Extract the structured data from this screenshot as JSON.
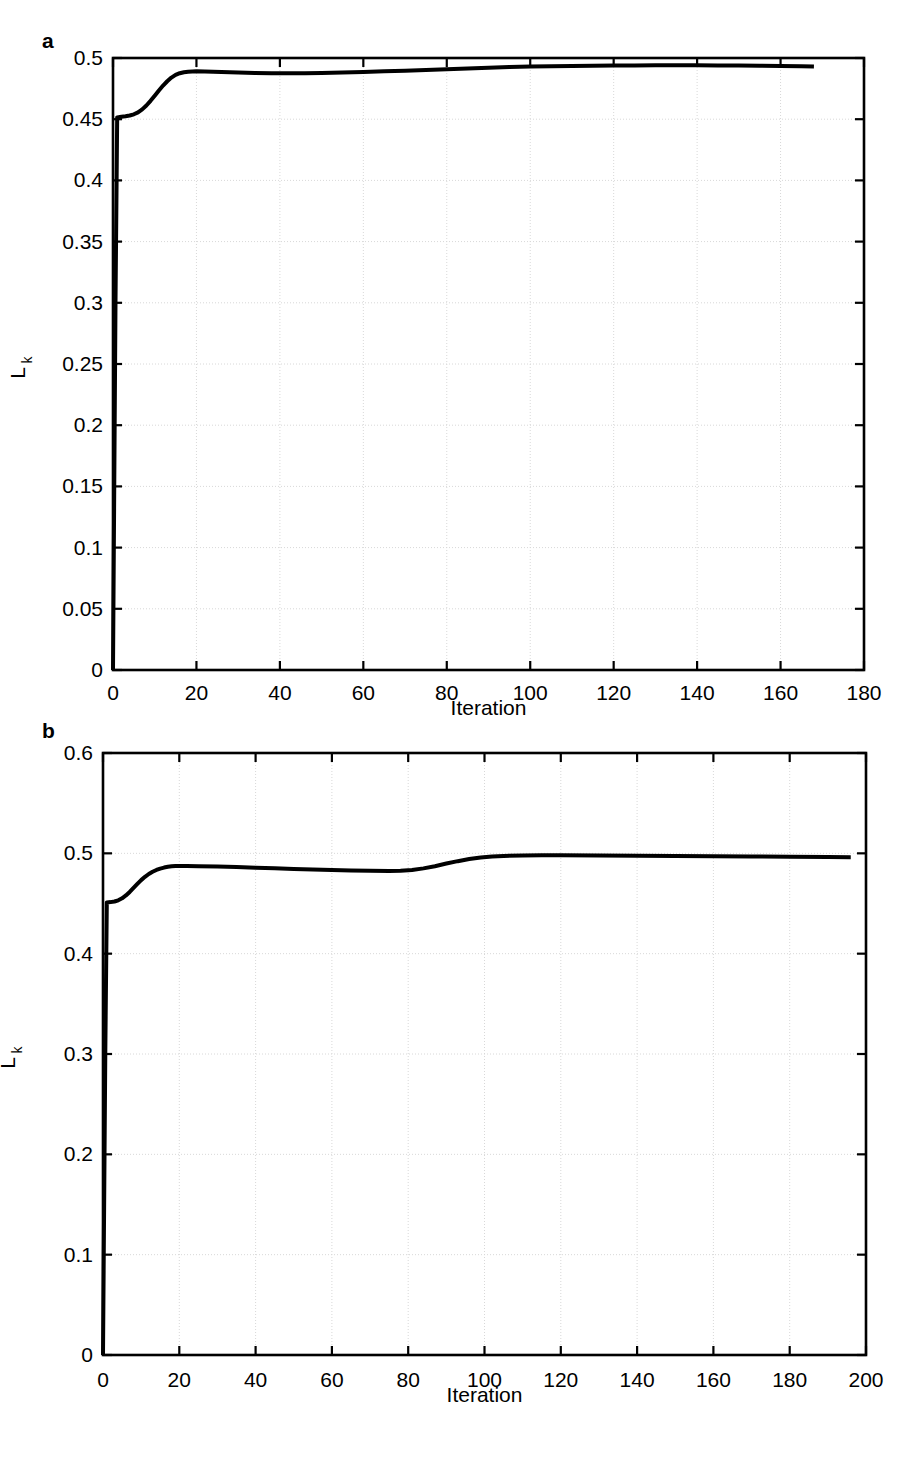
{
  "figure": {
    "panels": [
      {
        "id": "a",
        "label": "a",
        "chart_ref": 0
      },
      {
        "id": "b",
        "label": "b",
        "chart_ref": 1
      }
    ]
  },
  "chart_data": [
    {
      "type": "line",
      "panel_label": "a",
      "title": "",
      "xlabel": "Iteration",
      "ylabel": "L_k",
      "ylabel_base": "L",
      "ylabel_sub": "k",
      "xlim": [
        0,
        180
      ],
      "ylim": [
        0,
        0.5
      ],
      "xticks": [
        0,
        20,
        40,
        60,
        80,
        100,
        120,
        140,
        160,
        180
      ],
      "xticklabels": [
        "0",
        "20",
        "40",
        "60",
        "80",
        "100",
        "120",
        "140",
        "160",
        "180"
      ],
      "yticks": [
        0,
        0.05,
        0.1,
        0.15,
        0.2,
        0.25,
        0.3,
        0.35,
        0.4,
        0.45,
        0.5
      ],
      "yticklabels": [
        "0",
        "0.05",
        "0.1",
        "0.15",
        "0.2",
        "0.25",
        "0.3",
        "0.35",
        "0.4",
        "0.45",
        "0.5"
      ],
      "grid": true,
      "legend": null,
      "line_color": "#000000",
      "line_width": 4,
      "series": [
        {
          "name": "Lk",
          "x": [
            0,
            0.6,
            1,
            2,
            3,
            4,
            5,
            6,
            7,
            8,
            9,
            10,
            11,
            12,
            13,
            14,
            15,
            16,
            17,
            18,
            19,
            20,
            22,
            24,
            26,
            28,
            30,
            34,
            38,
            42,
            46,
            50,
            55,
            60,
            65,
            70,
            75,
            80,
            85,
            90,
            95,
            100,
            105,
            110,
            115,
            120,
            125,
            130,
            135,
            140,
            145,
            150,
            155,
            160,
            165,
            168
          ],
          "y": [
            0.0,
            0.3,
            0.4515,
            0.452,
            0.4524,
            0.453,
            0.454,
            0.4556,
            0.458,
            0.4612,
            0.465,
            0.4692,
            0.4735,
            0.4775,
            0.481,
            0.484,
            0.4862,
            0.4876,
            0.4884,
            0.4888,
            0.489,
            0.4891,
            0.489,
            0.4888,
            0.4886,
            0.4884,
            0.4882,
            0.4878,
            0.4876,
            0.4875,
            0.4876,
            0.4878,
            0.4882,
            0.4886,
            0.4891,
            0.4896,
            0.4902,
            0.4908,
            0.4915,
            0.4921,
            0.4926,
            0.493,
            0.4933,
            0.4935,
            0.4937,
            0.4938,
            0.4939,
            0.494,
            0.494,
            0.494,
            0.4939,
            0.4938,
            0.4937,
            0.4935,
            0.4933,
            0.4931
          ]
        }
      ]
    },
    {
      "type": "line",
      "panel_label": "b",
      "title": "",
      "xlabel": "Iteration",
      "ylabel": "L_k",
      "ylabel_base": "L",
      "ylabel_sub": "k",
      "xlim": [
        0,
        200
      ],
      "ylim": [
        0,
        0.6
      ],
      "xticks": [
        0,
        20,
        40,
        60,
        80,
        100,
        120,
        140,
        160,
        180,
        200
      ],
      "xticklabels": [
        "0",
        "20",
        "40",
        "60",
        "80",
        "100",
        "120",
        "140",
        "160",
        "180",
        "200"
      ],
      "yticks": [
        0,
        0.1,
        0.2,
        0.3,
        0.4,
        0.5,
        0.6
      ],
      "yticklabels": [
        "0",
        "0.1",
        "0.2",
        "0.3",
        "0.4",
        "0.5",
        "0.6"
      ],
      "grid": true,
      "legend": null,
      "line_color": "#000000",
      "line_width": 4,
      "series": [
        {
          "name": "Lk",
          "x": [
            0,
            0.6,
            1,
            2,
            3,
            4,
            5,
            6,
            7,
            8,
            9,
            10,
            11,
            12,
            13,
            14,
            15,
            16,
            17,
            18,
            19,
            20,
            22,
            25,
            30,
            35,
            40,
            45,
            50,
            55,
            60,
            65,
            70,
            75,
            78,
            81,
            84,
            87,
            90,
            93,
            96,
            99,
            102,
            105,
            110,
            115,
            120,
            130,
            140,
            150,
            160,
            170,
            180,
            190,
            196
          ],
          "y": [
            0.0,
            0.3,
            0.451,
            0.4514,
            0.452,
            0.4532,
            0.4552,
            0.458,
            0.4615,
            0.4655,
            0.4695,
            0.4733,
            0.4766,
            0.4794,
            0.4816,
            0.4834,
            0.4848,
            0.4858,
            0.4866,
            0.4871,
            0.4874,
            0.4875,
            0.4874,
            0.4872,
            0.4868,
            0.4863,
            0.4857,
            0.4851,
            0.4845,
            0.484,
            0.4835,
            0.483,
            0.4826,
            0.4824,
            0.4826,
            0.4834,
            0.485,
            0.4872,
            0.4898,
            0.4922,
            0.4943,
            0.4958,
            0.4968,
            0.4974,
            0.4979,
            0.498,
            0.498,
            0.4978,
            0.4976,
            0.4974,
            0.4971,
            0.4969,
            0.4966,
            0.4963,
            0.4962
          ]
        }
      ]
    }
  ]
}
